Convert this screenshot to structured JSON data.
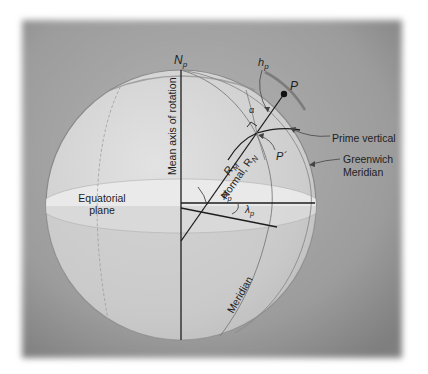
{
  "figure": {
    "labels": {
      "north_pole": "N",
      "north_pole_sub": "p",
      "axis": "Mean axis of rotation",
      "height": "h",
      "height_sub": "p",
      "point": "P",
      "surface_point": "P´",
      "alpha": "α",
      "prime_vertical": "Prime vertical",
      "greenwich_line1": "Greenwich",
      "greenwich_line2": "Meridian",
      "radius_meridian": "R",
      "radius_meridian_sub": "M",
      "normal": "Normal, R",
      "normal_sub": "N",
      "equatorial_line1": "Equatorial",
      "equatorial_line2": "plane",
      "latitude": "ϕ",
      "latitude_sub": "p",
      "longitude": "λ",
      "longitude_sub": "p",
      "meridian": "Meridian"
    },
    "colors": {
      "background": "#ffffff",
      "frame": "#9a9a9a",
      "sphere": "#d4d4d4",
      "equator_band": "#e6e6e6",
      "lines": "#1e1e1e",
      "arcs": "#6f6f6f"
    }
  }
}
